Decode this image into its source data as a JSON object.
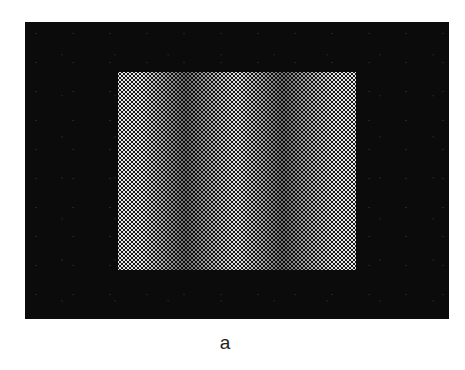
{
  "figure": {
    "panel_label": "a",
    "surround": {
      "color": "#0b0b0b",
      "bounds_px": {
        "left": 25,
        "top": 22,
        "right": 449,
        "bottom": 319
      }
    },
    "grating": {
      "orientation": "vertical",
      "bounds_px": {
        "left": 118,
        "top": 72,
        "right": 356,
        "bottom": 270
      },
      "profile": "sinusoidal",
      "cycles_visible": 2.5,
      "light_band_centers_px": [
        140,
        237,
        335
      ],
      "dark_band_centers_px": [
        185,
        283
      ],
      "light_color": "#e6e6e6",
      "dark_color": "#6e6e6e",
      "halftone_pitch_px": 4
    }
  }
}
